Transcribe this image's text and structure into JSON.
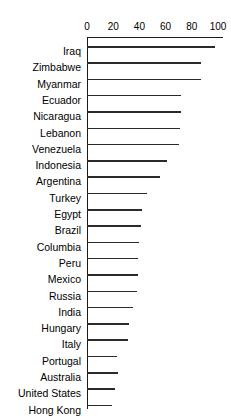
{
  "chart_data": {
    "type": "bar",
    "orientation": "horizontal",
    "title": "",
    "subtitle": "",
    "xlabel": "",
    "ylabel": "",
    "xlim": [
      0,
      100
    ],
    "ylim": null,
    "grid": false,
    "legend": null,
    "legend_position": "none",
    "axis_position": "top",
    "xticks": [
      0,
      20,
      40,
      60,
      80,
      100
    ],
    "xtick_labels": [
      "0",
      "20",
      "40",
      "60",
      "80",
      "100"
    ],
    "categories": [
      "Iraq",
      "Zimbabwe",
      "Myanmar",
      "Ecuador",
      "Nicaragua",
      "Lebanon",
      "Venezuela",
      "Indonesia",
      "Argentina",
      "Turkey",
      "Egypt",
      "Brazil",
      "Columbia",
      "Peru",
      "Mexico",
      "Russia",
      "India",
      "Hungary",
      "Italy",
      "Portugal",
      "Australia",
      "United States",
      "Hong Kong"
    ],
    "values": [
      98,
      87,
      87,
      72,
      72,
      71,
      70,
      61,
      56,
      46,
      42,
      41,
      40,
      39,
      39,
      38,
      35,
      32,
      31,
      23,
      24,
      21,
      19
    ],
    "bar_color": "#2b2b2b",
    "axis_color": "#1a1a1a"
  }
}
